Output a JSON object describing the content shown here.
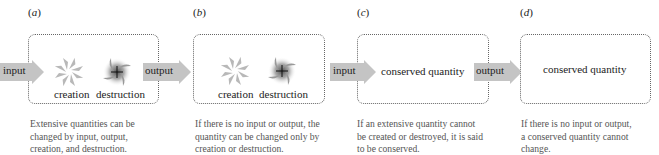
{
  "panels": [
    {
      "id": "a",
      "label": "a",
      "input_label": "input",
      "output_label": "output",
      "creation_label": "creation",
      "destruction_label": "destruction",
      "caption": [
        "Extensive quantities can be",
        "changed by input, output,",
        "creation, and destruction."
      ]
    },
    {
      "id": "b",
      "label": "b",
      "creation_label": "creation",
      "destruction_label": "destruction",
      "caption": [
        "If there is no input or output, the",
        "quantity can be changed only by",
        "creation or destruction."
      ]
    },
    {
      "id": "c",
      "label": "c",
      "input_label": "input",
      "output_label": "output",
      "center_label": "conserved quantity",
      "caption": [
        "If an extensive quantity cannot",
        "be created or destroyed, it is said",
        "to be conserved."
      ]
    },
    {
      "id": "d",
      "label": "d",
      "center_label": "conserved quantity",
      "caption": [
        "If there is no input or output,",
        "a conserved quantity cannot",
        "change."
      ]
    }
  ],
  "icons": {
    "creation": "pinwheel-icon",
    "destruction": "vortex-sink-icon",
    "flow": "arrow-right-icon"
  },
  "colors": {
    "arrow_fill": "#c4c4c4",
    "box_border": "#666666",
    "caption_text": "#555555",
    "pinwheel": "#b8b8b8",
    "vortex": "#888888"
  }
}
